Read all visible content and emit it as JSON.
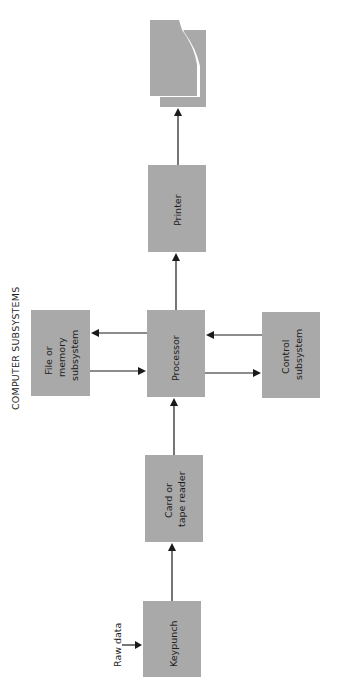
{
  "diagram": {
    "title": "COMPUTER SUBSYSTEMS",
    "orientation": "rotated 90° counter-clockwise",
    "colors": {
      "box_fill": "#a9a9a9",
      "arrow": "#1a1a1a",
      "background": "#ffffff"
    },
    "input_label": "Raw data",
    "nodes": [
      {
        "id": "keypunch",
        "lines": [
          "Keypunch"
        ]
      },
      {
        "id": "reader",
        "lines": [
          "Card or",
          "tape reader"
        ]
      },
      {
        "id": "processor",
        "lines": [
          "Processor"
        ]
      },
      {
        "id": "file",
        "lines": [
          "File or",
          "memory",
          "subsystem"
        ]
      },
      {
        "id": "control",
        "lines": [
          "Control",
          "subsystem"
        ]
      },
      {
        "id": "printer",
        "lines": [
          "Printer"
        ]
      },
      {
        "id": "output",
        "lines": [],
        "shape": "document-stack-icon"
      }
    ],
    "edges": [
      {
        "from": "raw-data",
        "to": "keypunch"
      },
      {
        "from": "keypunch",
        "to": "reader"
      },
      {
        "from": "reader",
        "to": "processor"
      },
      {
        "from": "processor",
        "to": "file"
      },
      {
        "from": "file",
        "to": "processor"
      },
      {
        "from": "control",
        "to": "processor"
      },
      {
        "from": "processor",
        "to": "control"
      },
      {
        "from": "processor",
        "to": "printer"
      },
      {
        "from": "printer",
        "to": "output"
      }
    ]
  }
}
